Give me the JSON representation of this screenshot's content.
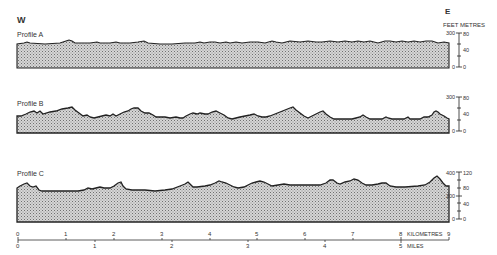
{
  "header": {
    "west_label": "W",
    "east_label": "E",
    "feet_label": "FEET",
    "metres_label": "METRES"
  },
  "profiles": [
    {
      "id": "A",
      "label": "Profile A",
      "feet_ticks": [
        "300",
        "0"
      ],
      "metre_ticks": [
        "80",
        "40",
        "0"
      ]
    },
    {
      "id": "B",
      "label": "Profile B",
      "feet_ticks": [
        "300",
        "0"
      ],
      "metre_ticks": [
        "80",
        "40",
        "0"
      ]
    },
    {
      "id": "C",
      "label": "Profile C",
      "feet_ticks": [
        "400",
        "200",
        "0"
      ],
      "metre_ticks": [
        "120",
        "80",
        "40",
        "0"
      ]
    }
  ],
  "scale_bar": {
    "km_ticks": [
      "0",
      "1",
      "2",
      "3",
      "4",
      "5",
      "6",
      "7",
      "8",
      "9"
    ],
    "km_label": "KILOMETRES",
    "mile_ticks": [
      "0",
      "1",
      "2",
      "3",
      "4",
      "5"
    ],
    "mile_label": "MILES"
  },
  "colors": {
    "fill_pattern_dark": "#6a6a6a",
    "fill_pattern_light": "#d8d8d8",
    "outline": "#222222"
  }
}
